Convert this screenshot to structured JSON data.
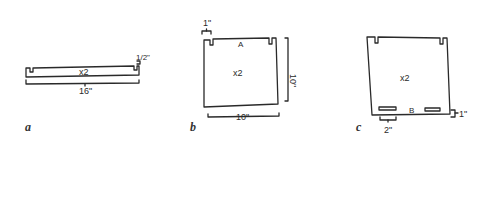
{
  "figure": {
    "panels": [
      {
        "id": "a",
        "label": "a",
        "part": {
          "quantity": "x2",
          "length": "16\"",
          "notch_depth": "1/2\""
        }
      },
      {
        "id": "b",
        "label": "b",
        "part": {
          "quantity": "x2",
          "name": "A",
          "width": "10\"",
          "height": "10\"",
          "notch_offset": "1\""
        }
      },
      {
        "id": "c",
        "label": "c",
        "part": {
          "quantity": "x2",
          "name": "B",
          "slot_length": "2\"",
          "slot_offset": "1\""
        }
      }
    ],
    "stroke_color": "#2a2a2a",
    "background": "#ffffff"
  }
}
